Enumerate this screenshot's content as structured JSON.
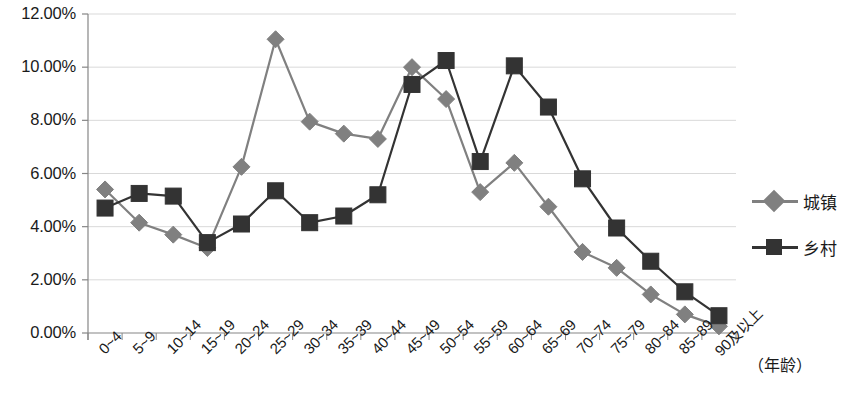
{
  "chart_data": {
    "type": "line",
    "title": "",
    "subtitle": "",
    "xlabel": "（年龄）",
    "ylabel": "",
    "ylim": [
      0,
      12
    ],
    "ytick_values": [
      0,
      2,
      4,
      6,
      8,
      10,
      12
    ],
    "ytick_labels": [
      "0.00%",
      "2.00%",
      "4.00%",
      "6.00%",
      "8.00%",
      "10.00%",
      "12.00%"
    ],
    "grid": true,
    "legend_position": "right",
    "categories": [
      "0~4",
      "5~9",
      "10~14",
      "15~19",
      "20~24",
      "25~29",
      "30~34",
      "35~39",
      "40~44",
      "45~49",
      "50~54",
      "55~59",
      "60~64",
      "65~69",
      "70~74",
      "75~79",
      "80~84",
      "85~89",
      "90及以上"
    ],
    "series": [
      {
        "name": "城镇",
        "color": "#808080",
        "marker": "diamond",
        "values": [
          5.4,
          4.15,
          3.7,
          3.2,
          6.25,
          11.05,
          7.95,
          7.5,
          7.3,
          10.0,
          8.8,
          5.3,
          6.4,
          4.75,
          3.05,
          2.45,
          1.45,
          0.7,
          0.25
        ]
      },
      {
        "name": "乡村",
        "color": "#333333",
        "marker": "square",
        "values": [
          4.7,
          5.25,
          5.15,
          3.4,
          4.1,
          5.35,
          4.15,
          4.4,
          5.2,
          9.35,
          10.25,
          6.45,
          10.05,
          8.5,
          5.8,
          3.95,
          2.7,
          1.55,
          0.65
        ]
      }
    ]
  },
  "legend": {
    "items": [
      {
        "label": "城镇",
        "color": "#808080",
        "marker": "diamond"
      },
      {
        "label": "乡村",
        "color": "#333333",
        "marker": "square"
      }
    ]
  },
  "axis": {
    "unit_label": "（年龄）"
  },
  "style": {
    "grid_color": "#d9d9d9",
    "axis_color": "#868686",
    "plot_background": "#ffffff",
    "urban_color": "#808080",
    "rural_color": "#333333"
  }
}
